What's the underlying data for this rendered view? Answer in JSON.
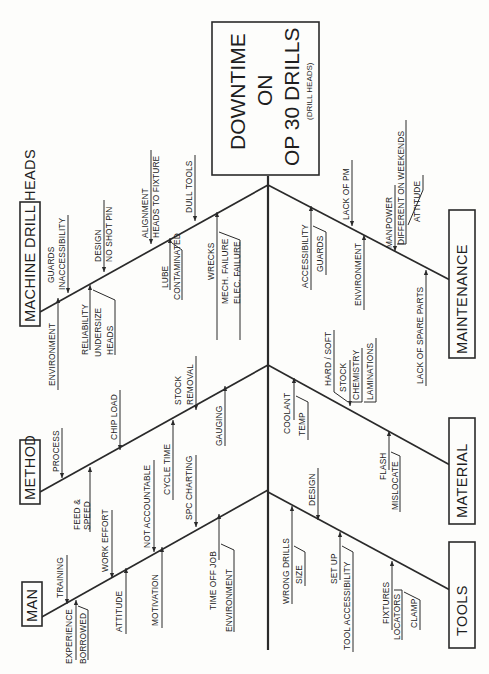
{
  "diagram": {
    "type": "fishbone",
    "orientation": "rotated-90-ccw",
    "effect": {
      "line1": "DOWNTIME",
      "line2": "ON",
      "line3": "OP 30 DRILLS",
      "line4": "(DRILL HEADS)"
    },
    "categories": [
      {
        "name": "MACHINE DRILL HEADS",
        "side": "top",
        "causes": [
          "ENVIRONMENT",
          "GUARDS",
          "INACCESSIBILITY",
          "RELIABILITY",
          "UNDERSIZE",
          "HEADS",
          "DESIGN",
          "NO SHOT PIN",
          "LUBE",
          "CONTAMINATED",
          "ALIGNMENT",
          "HEADS TO FIXTURE",
          "WRECKS",
          "MECH. FAILURE",
          "ELEC. FAILURE",
          "DULL TOOLS"
        ]
      },
      {
        "name": "METHOD",
        "side": "top",
        "causes": [
          "PROCESS",
          "FEED &",
          "SPEED",
          "CHIP LOAD",
          "CYCLE TIME",
          "STOCK",
          "REMOVAL",
          "GAUGING"
        ]
      },
      {
        "name": "MAN",
        "side": "top",
        "causes": [
          "TRAINING",
          "EXPERIENCE",
          "BORROWED",
          "WORK EFFORT",
          "ATTITUDE",
          "NOT ACCOUNTABLE",
          "MOTIVATION",
          "SPC CHARTING",
          "TIME OFF JOB",
          "ENVIRONMENT"
        ]
      },
      {
        "name": "MAINTENANCE",
        "side": "bottom",
        "causes": [
          "ACCESSIBILITY",
          "GUARDS",
          "LACK OF PM",
          "ENVIRONMENT",
          "MANPOWER",
          "DIFFERENT ON WEEKENDS",
          "ATTITUDE",
          "LACK OF SPARE PARTS"
        ]
      },
      {
        "name": "MATERIAL",
        "side": "bottom",
        "causes": [
          "COOLANT",
          "TEMP",
          "HARD / SOFT",
          "STOCK",
          "CHEMISTRY",
          "LAMINATIONS",
          "FLASH",
          "MISLOCATE"
        ]
      },
      {
        "name": "TOOLS",
        "side": "bottom",
        "causes": [
          "WRONG DRILLS",
          "SIZE",
          "DESIGN",
          "SET UP",
          "TOOL ACCESSIBILITY",
          "FIXTURES",
          "LOCATORS",
          "CLAMP"
        ]
      }
    ]
  },
  "labels": {
    "mdh": {
      "title": "MACHINE DRILL HEADS",
      "environment": "ENVIRONMENT",
      "guards": "GUARDS",
      "inaccessibility": "INACCESSIBILITY",
      "reliability": "RELIABILITY",
      "undersize": "UNDERSIZE",
      "heads": "HEADS",
      "design": "DESIGN",
      "no_shot_pin": "NO SHOT PIN",
      "lube": "LUBE",
      "contaminated": "CONTAMINATED",
      "alignment": "ALIGNMENT",
      "heads_to_fixture": "HEADS TO FIXTURE",
      "wrecks": "WRECKS",
      "mech_failure": "MECH. FAILURE",
      "elec_failure": "ELEC. FAILURE",
      "dull_tools": "DULL TOOLS"
    },
    "method": {
      "title": "METHOD",
      "process": "PROCESS",
      "feed": "FEED &",
      "speed": "SPEED",
      "chip_load": "CHIP LOAD",
      "cycle_time": "CYCLE TIME",
      "stock": "STOCK",
      "removal": "REMOVAL",
      "gauging": "GAUGING"
    },
    "man": {
      "title": "MAN",
      "training": "TRAINING",
      "experience": "EXPERIENCE",
      "borrowed": "BORROWED",
      "work_effort": "WORK EFFORT",
      "attitude": "ATTITUDE",
      "not_accountable": "NOT ACCOUNTABLE",
      "motivation": "MOTIVATION",
      "spc_charting": "SPC CHARTING",
      "time_off_job": "TIME OFF JOB",
      "environment": "ENVIRONMENT"
    },
    "maint": {
      "title": "MAINTENANCE",
      "accessibility": "ACCESSIBILITY",
      "guards": "GUARDS",
      "lack_of_pm": "LACK OF PM",
      "environment": "ENVIRONMENT",
      "manpower": "MANPOWER",
      "different_weekends": "DIFFERENT ON WEEKENDS",
      "attitude": "ATTITUDE",
      "spare_parts": "LACK OF SPARE PARTS"
    },
    "material": {
      "title": "MATERIAL",
      "coolant": "COOLANT",
      "temp": "TEMP",
      "hard_soft": "HARD / SOFT",
      "stock": "STOCK",
      "chemistry": "CHEMISTRY",
      "laminations": "LAMINATIONS",
      "flash": "FLASH",
      "mislocate": "MISLOCATE"
    },
    "tools": {
      "title": "TOOLS",
      "wrong_drills": "WRONG DRILLS",
      "size": "SIZE",
      "design": "DESIGN",
      "set_up": "SET UP",
      "tool_access": "TOOL ACCESSIBILITY",
      "fixtures": "FIXTURES",
      "locators": "LOCATORS",
      "clamp": "CLAMP"
    }
  }
}
